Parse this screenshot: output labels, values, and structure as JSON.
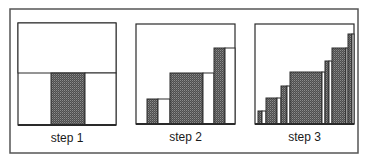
{
  "figure": {
    "colors": {
      "background": "#ffffff",
      "stroke": "#2a2a2a",
      "frame": "#555555",
      "shade": "#5a5a5a",
      "shade_dot": "#8a8a8a",
      "open": "#ffffff"
    },
    "panels": [
      {
        "label": "step 1",
        "box": {
          "x": 18,
          "y": 23,
          "w": 98,
          "h": 102
        },
        "regions": [
          {
            "type": "open",
            "x": 18,
            "y": 23,
            "w": 98,
            "h": 50
          },
          {
            "type": "shaded",
            "x": 51,
            "y": 73,
            "w": 34,
            "h": 52
          },
          {
            "type": "open",
            "x": 85,
            "y": 73,
            "w": 31,
            "h": 52
          }
        ]
      },
      {
        "label": "step 2",
        "box": {
          "x": 136,
          "y": 24,
          "w": 99,
          "h": 100
        },
        "regions": [
          {
            "type": "shaded",
            "x": 147,
            "y": 99,
            "w": 11,
            "h": 25
          },
          {
            "type": "open",
            "x": 158,
            "y": 99,
            "w": 12,
            "h": 25
          },
          {
            "type": "shaded",
            "x": 170,
            "y": 73,
            "w": 33,
            "h": 51
          },
          {
            "type": "open",
            "x": 203,
            "y": 73,
            "w": 11,
            "h": 51
          },
          {
            "type": "shaded",
            "x": 214,
            "y": 48,
            "w": 11,
            "h": 76
          },
          {
            "type": "open",
            "x": 225,
            "y": 48,
            "w": 10,
            "h": 76
          }
        ]
      },
      {
        "label": "step 3",
        "box": {
          "x": 255,
          "y": 24,
          "w": 99,
          "h": 100
        },
        "regions": [
          {
            "type": "shaded",
            "x": 258,
            "y": 111,
            "w": 4,
            "h": 13
          },
          {
            "type": "open",
            "x": 262,
            "y": 111,
            "w": 4,
            "h": 13
          },
          {
            "type": "shaded",
            "x": 266,
            "y": 98,
            "w": 11,
            "h": 26
          },
          {
            "type": "open",
            "x": 277,
            "y": 98,
            "w": 4,
            "h": 26
          },
          {
            "type": "shaded",
            "x": 281,
            "y": 86,
            "w": 6,
            "h": 38
          },
          {
            "type": "open",
            "x": 287,
            "y": 86,
            "w": 3,
            "h": 38
          },
          {
            "type": "shaded",
            "x": 290,
            "y": 72,
            "w": 32,
            "h": 52
          },
          {
            "type": "open",
            "x": 322,
            "y": 72,
            "w": 3,
            "h": 52
          },
          {
            "type": "shaded",
            "x": 325,
            "y": 61,
            "w": 4,
            "h": 63
          },
          {
            "type": "open",
            "x": 329,
            "y": 61,
            "w": 3,
            "h": 63
          },
          {
            "type": "shaded",
            "x": 332,
            "y": 48,
            "w": 14,
            "h": 76
          },
          {
            "type": "open",
            "x": 346,
            "y": 48,
            "w": 2,
            "h": 76
          },
          {
            "type": "shaded",
            "x": 348,
            "y": 34,
            "w": 4,
            "h": 90
          },
          {
            "type": "open",
            "x": 352,
            "y": 34,
            "w": 2,
            "h": 90
          }
        ]
      }
    ],
    "outer_frame": {
      "x": 10,
      "y": 9,
      "w": 348,
      "h": 144
    }
  }
}
